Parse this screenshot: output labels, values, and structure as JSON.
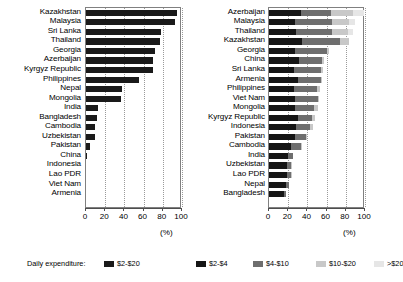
{
  "chart_data": [
    {
      "type": "bar",
      "panel": "left",
      "orientation": "horizontal",
      "title": "",
      "xlabel": "(%)",
      "ylabel": "",
      "xlim": [
        0,
        100
      ],
      "xticks": [
        0,
        20,
        40,
        60,
        80,
        100
      ],
      "xticklabels": [
        "0",
        "20",
        "40",
        "60",
        "80",
        "100"
      ],
      "grid": "vertical-dotted",
      "legend_position": "bottom-left",
      "series": [
        {
          "name": "$2-$20",
          "color": "#1a1a1a",
          "values": [
            95,
            93,
            78,
            77,
            72,
            70,
            70,
            55,
            38,
            36,
            12,
            11,
            9,
            9,
            4,
            1,
            0,
            0,
            0,
            0,
            0
          ]
        }
      ],
      "categories": [
        "Kazakhstan",
        "Malaysia",
        "Sri Lanka",
        "Thailand",
        "Georgia",
        "Azerbaijan",
        "Kyrgyz Republic",
        "Philippines",
        "Nepal",
        "Mongolia",
        "India",
        "Bangladesh",
        "Cambodia",
        "Uzbekistan",
        "Pakistan",
        "China",
        "Indonesia",
        "Lao PDR",
        "Viet Nam",
        "Armenia"
      ]
    },
    {
      "type": "bar",
      "panel": "right",
      "orientation": "horizontal",
      "stacked": true,
      "title": "",
      "xlabel": "(%)",
      "ylabel": "",
      "xlim": [
        0,
        100
      ],
      "xticks": [
        0,
        20,
        40,
        60,
        80,
        100
      ],
      "xticklabels": [
        "0",
        "20",
        "40",
        "60",
        "80",
        "100"
      ],
      "grid": "vertical-dotted",
      "legend_position": "bottom-right",
      "categories": [
        "Azerbaijan",
        "Malaysia",
        "Thailand",
        "Kazakhstan",
        "Georgia",
        "China",
        "Sri Lanka",
        "Armenia",
        "Philippines",
        "Viet Nam",
        "Mongolia",
        "Kyrgyz Republic",
        "Indonesia",
        "Pakistan",
        "Cambodia",
        "India",
        "Uzbekistan",
        "Lao PDR",
        "Nepal",
        "Bangladesh"
      ],
      "series": [
        {
          "name": "$2-$4",
          "color": "#151515",
          "values": [
            33,
            27,
            28,
            34,
            27,
            31,
            26,
            30,
            26,
            27,
            27,
            30,
            28,
            27,
            23,
            20,
            19,
            19,
            18,
            16
          ]
        },
        {
          "name": "$4-$10",
          "color": "#6e6e6e",
          "values": [
            32,
            39,
            38,
            40,
            33,
            24,
            28,
            24,
            24,
            24,
            20,
            15,
            15,
            12,
            10,
            5,
            4,
            4,
            3,
            2
          ]
        },
        {
          "name": "$10-$20",
          "color": "#c8c8c8",
          "values": [
            22,
            17,
            16,
            9,
            3,
            2,
            2,
            1,
            3,
            1,
            4,
            3,
            3,
            1,
            1,
            0,
            1,
            1,
            0,
            0
          ]
        },
        {
          "name": ">$20",
          "color": "#e6e6e6",
          "values": [
            12,
            7,
            6,
            0,
            0,
            0,
            0,
            0,
            0,
            0,
            0,
            0,
            0,
            0,
            0,
            0,
            0,
            0,
            0,
            0
          ]
        }
      ]
    }
  ],
  "legend": {
    "title": "Daily expenditure:",
    "left_items": [
      {
        "label": "$2-$20",
        "color": "#1a1a1a"
      }
    ],
    "right_items": [
      {
        "label": "$2-$4",
        "color": "#151515"
      },
      {
        "label": "$4-$10",
        "color": "#6e6e6e"
      },
      {
        "label": "$10-$20",
        "color": "#c8c8c8"
      },
      {
        "label": ">$20",
        "color": "#e6e6e6"
      }
    ]
  },
  "axis_unit": "(%)"
}
